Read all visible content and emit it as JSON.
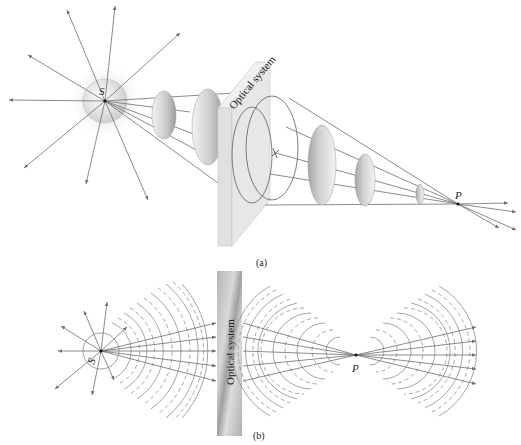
{
  "figure": {
    "panel_a": {
      "label": "(a)",
      "source_label": "S",
      "point_label": "P",
      "system_label": "Optical system"
    },
    "panel_b": {
      "label": "(b)",
      "source_label": "S",
      "point_label": "P",
      "system_label": "Optical system"
    }
  },
  "colors": {
    "ray": "#6d6d6d",
    "wave": "#9a9a9a",
    "slab_light": "#e4e4e4",
    "slab_dark": "#a9a9a9"
  }
}
